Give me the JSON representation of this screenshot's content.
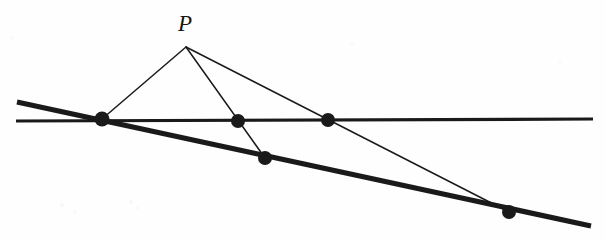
{
  "figure": {
    "kind": "geometry-diagram",
    "width": 606,
    "height": 241,
    "background_color": "#fefefe",
    "ink_color": "#1a1a1a",
    "labels": [
      {
        "id": "P",
        "text": "P",
        "x": 185,
        "y": 23,
        "font_size": 23,
        "style": "italic-serif"
      }
    ],
    "lines": [
      {
        "id": "horizontal-line",
        "name": "horizontal-line",
        "x1": 16,
        "y1": 121,
        "x2": 593,
        "y2": 119,
        "stroke_width": 3.2,
        "color": "#1a1a1a"
      },
      {
        "id": "oblique-line",
        "name": "oblique-line",
        "x1": 17,
        "y1": 102,
        "x2": 591,
        "y2": 226,
        "stroke_width": 5.2,
        "color": "#1a1a1a"
      }
    ],
    "rays": [
      {
        "id": "ray-p-to-a",
        "name": "ray-p-to-left-intersection",
        "x1": 186,
        "y1": 47,
        "x2": 102,
        "y2": 119,
        "stroke_width": 1.5,
        "color": "#1a1a1a"
      },
      {
        "id": "ray-p-to-c",
        "name": "ray-p-through-mid-horizontal-to-oblique",
        "x1": 186,
        "y1": 47,
        "x2": 265,
        "y2": 158,
        "stroke_width": 1.5,
        "color": "#1a1a1a"
      },
      {
        "id": "ray-p-to-e",
        "name": "ray-p-through-right-horizontal-to-oblique",
        "x1": 186,
        "y1": 47,
        "x2": 509,
        "y2": 212,
        "stroke_width": 1.5,
        "color": "#1a1a1a"
      }
    ],
    "points": [
      {
        "id": "A",
        "name": "intersection-point-left",
        "x": 102,
        "y": 119,
        "radius": 7.5,
        "on": [
          "horizontal-line",
          "oblique-line",
          "ray-p-to-a"
        ]
      },
      {
        "id": "B",
        "name": "point-mid-horizontal",
        "x": 238,
        "y": 121,
        "radius": 7.0,
        "on": [
          "horizontal-line",
          "ray-p-to-c"
        ]
      },
      {
        "id": "C",
        "name": "point-on-oblique-mid",
        "x": 265,
        "y": 158,
        "radius": 7.0,
        "on": [
          "oblique-line",
          "ray-p-to-c"
        ]
      },
      {
        "id": "D",
        "name": "point-right-horizontal",
        "x": 328,
        "y": 120,
        "radius": 7.0,
        "on": [
          "horizontal-line",
          "ray-p-to-e"
        ]
      },
      {
        "id": "E",
        "name": "point-on-oblique-right",
        "x": 509,
        "y": 212,
        "radius": 7.0,
        "on": [
          "oblique-line",
          "ray-p-to-e"
        ]
      }
    ],
    "apex": {
      "id": "P",
      "name": "apex-point-p",
      "x": 186,
      "y": 47
    }
  }
}
